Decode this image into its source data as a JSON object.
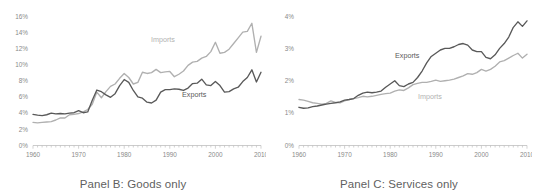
{
  "figure": {
    "panels": [
      {
        "id": "panel-b",
        "caption": "Panel B: Goods only",
        "series_labels": {
          "exports": "Exports",
          "imports": "Imports"
        }
      },
      {
        "id": "panel-c",
        "caption": "Panel C: Services only",
        "series_labels": {
          "exports": "Exports",
          "imports": "Imports"
        }
      }
    ]
  },
  "colors": {
    "exports_line": "#595959",
    "imports_line": "#b0b0b0",
    "axis": "#bfbfbf",
    "tick_text": "#8a8a8a",
    "caption_text": "#5f5f5f",
    "background": "#ffffff"
  },
  "chart_data": [
    {
      "type": "line",
      "title": "Panel B: Goods only",
      "xlabel": "",
      "ylabel": "",
      "xlim": [
        1960,
        2010
      ],
      "ylim": [
        0,
        16
      ],
      "yticks": [
        0,
        2,
        4,
        6,
        8,
        10,
        12,
        14,
        16
      ],
      "ytick_labels": [
        "0%",
        "2%",
        "4%",
        "6%",
        "8%",
        "10%",
        "12%",
        "14%",
        "16%"
      ],
      "xticks": [
        1960,
        1970,
        1980,
        1990,
        2000,
        2010
      ],
      "xtick_labels": [
        "1960",
        "1970",
        "1980",
        "1990",
        "2000",
        "2010"
      ],
      "grid": false,
      "legend": "inline-annotation",
      "x": [
        1960,
        1961,
        1962,
        1963,
        1964,
        1965,
        1966,
        1967,
        1968,
        1969,
        1970,
        1971,
        1972,
        1973,
        1974,
        1975,
        1976,
        1977,
        1978,
        1979,
        1980,
        1981,
        1982,
        1983,
        1984,
        1985,
        1986,
        1987,
        1988,
        1989,
        1990,
        1991,
        1992,
        1993,
        1994,
        1995,
        1996,
        1997,
        1998,
        1999,
        2000,
        2001,
        2002,
        2003,
        2004,
        2005,
        2006,
        2007,
        2008,
        2009,
        2010
      ],
      "series": [
        {
          "name": "Exports",
          "color": "#595959",
          "values": [
            3.85,
            3.75,
            3.7,
            3.8,
            4.0,
            3.9,
            3.95,
            3.9,
            4.0,
            4.05,
            4.3,
            4.05,
            4.15,
            5.6,
            6.85,
            6.65,
            6.25,
            5.95,
            6.4,
            7.4,
            8.15,
            7.8,
            6.8,
            6.0,
            5.85,
            5.35,
            5.25,
            5.6,
            6.6,
            6.9,
            6.9,
            7.0,
            6.95,
            6.8,
            7.1,
            7.65,
            7.7,
            8.2,
            7.5,
            7.4,
            7.9,
            7.4,
            6.6,
            6.65,
            7.0,
            7.2,
            7.9,
            8.4,
            9.35,
            7.85,
            9.05
          ]
        },
        {
          "name": "Imports",
          "color": "#b0b0b0",
          "values": [
            2.85,
            2.8,
            2.85,
            2.9,
            2.95,
            3.15,
            3.4,
            3.4,
            3.8,
            3.85,
            3.95,
            4.15,
            4.45,
            5.1,
            6.6,
            5.9,
            6.65,
            7.3,
            7.6,
            8.3,
            8.9,
            8.4,
            7.6,
            7.8,
            9.05,
            8.9,
            9.0,
            9.4,
            9.0,
            9.1,
            9.15,
            8.5,
            8.8,
            9.2,
            9.9,
            10.3,
            10.4,
            10.8,
            11.0,
            11.6,
            12.75,
            11.4,
            11.5,
            11.9,
            12.6,
            13.3,
            14.0,
            14.1,
            15.1,
            11.5,
            13.5
          ]
        }
      ]
    },
    {
      "type": "line",
      "title": "Panel C: Services only",
      "xlabel": "",
      "ylabel": "",
      "xlim": [
        1960,
        2010
      ],
      "ylim": [
        0,
        4
      ],
      "yticks": [
        0,
        1,
        2,
        3,
        4
      ],
      "ytick_labels": [
        "0%",
        "1%",
        "2%",
        "3%",
        "4%"
      ],
      "xticks": [
        1960,
        1970,
        1980,
        1990,
        2000,
        2010
      ],
      "xtick_labels": [
        "1960",
        "1970",
        "1980",
        "1990",
        "2000",
        "2010"
      ],
      "grid": false,
      "legend": "inline-annotation",
      "x": [
        1960,
        1961,
        1962,
        1963,
        1964,
        1965,
        1966,
        1967,
        1968,
        1969,
        1970,
        1971,
        1972,
        1973,
        1974,
        1975,
        1976,
        1977,
        1978,
        1979,
        1980,
        1981,
        1982,
        1983,
        1984,
        1985,
        1986,
        1987,
        1988,
        1989,
        1990,
        1991,
        1992,
        1993,
        1994,
        1995,
        1996,
        1997,
        1998,
        1999,
        2000,
        2001,
        2002,
        2003,
        2004,
        2005,
        2006,
        2007,
        2008,
        2009,
        2010
      ],
      "series": [
        {
          "name": "Exports",
          "color": "#595959",
          "values": [
            1.18,
            1.15,
            1.16,
            1.2,
            1.22,
            1.25,
            1.28,
            1.3,
            1.32,
            1.35,
            1.4,
            1.42,
            1.45,
            1.55,
            1.62,
            1.65,
            1.63,
            1.65,
            1.68,
            1.8,
            1.9,
            2.0,
            1.85,
            1.82,
            1.9,
            1.95,
            2.1,
            2.3,
            2.55,
            2.75,
            2.85,
            2.95,
            3.0,
            3.0,
            3.05,
            3.12,
            3.15,
            3.1,
            2.95,
            2.9,
            2.9,
            2.72,
            2.68,
            2.8,
            3.0,
            3.15,
            3.35,
            3.65,
            3.82,
            3.68,
            3.85
          ]
        },
        {
          "name": "Imports",
          "color": "#b0b0b0",
          "values": [
            1.42,
            1.4,
            1.36,
            1.32,
            1.3,
            1.28,
            1.3,
            1.38,
            1.33,
            1.32,
            1.38,
            1.42,
            1.45,
            1.48,
            1.52,
            1.5,
            1.52,
            1.55,
            1.58,
            1.6,
            1.62,
            1.68,
            1.72,
            1.7,
            1.78,
            1.88,
            1.92,
            1.95,
            1.95,
            1.98,
            2.02,
            1.98,
            2.0,
            2.02,
            2.05,
            2.1,
            2.15,
            2.22,
            2.2,
            2.25,
            2.35,
            2.3,
            2.35,
            2.45,
            2.58,
            2.62,
            2.7,
            2.78,
            2.85,
            2.7,
            2.82
          ]
        }
      ]
    }
  ]
}
